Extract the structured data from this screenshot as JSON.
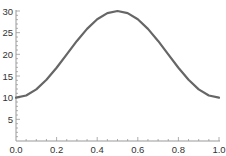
{
  "chart_data": {
    "type": "line",
    "title": "",
    "xlabel": "",
    "ylabel": "",
    "xlim": [
      0.0,
      1.0
    ],
    "ylim": [
      0,
      30
    ],
    "grid": false,
    "legend": null,
    "x_ticks": [
      "0.0",
      "0.2",
      "0.4",
      "0.6",
      "0.8",
      "1.0"
    ],
    "y_ticks": [
      "5",
      "10",
      "15",
      "20",
      "25",
      "30"
    ],
    "series": [
      {
        "name": "curve",
        "color": "#666666",
        "x": [
          0.0,
          0.05,
          0.1,
          0.15,
          0.2,
          0.25,
          0.3,
          0.35,
          0.4,
          0.45,
          0.5,
          0.55,
          0.6,
          0.65,
          0.7,
          0.75,
          0.8,
          0.85,
          0.9,
          0.95,
          1.0
        ],
        "y": [
          10.0,
          10.49,
          11.91,
          14.12,
          16.91,
          20.0,
          23.09,
          25.88,
          28.09,
          29.51,
          30.0,
          29.51,
          28.09,
          25.88,
          23.09,
          20.0,
          16.91,
          14.12,
          11.91,
          10.49,
          10.0
        ]
      }
    ]
  }
}
